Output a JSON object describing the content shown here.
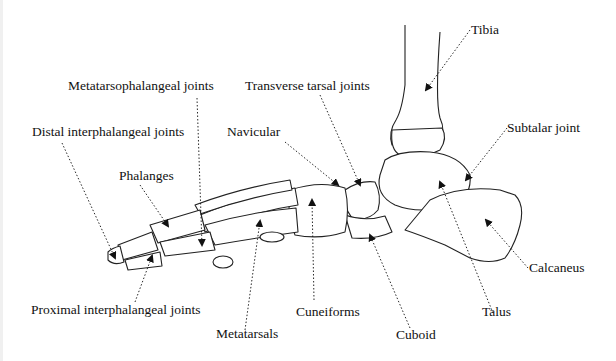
{
  "diagram": {
    "labels": {
      "tibia": "Tibia",
      "transverse_tarsal_joints": "Transverse tarsal joints",
      "metatarsophalangeal_joints": "Metatarsophalangeal joints",
      "distal_interphalangeal_joints": "Distal interphalangeal joints",
      "navicular": "Navicular",
      "subtalar_joint": "Subtalar joint",
      "phalanges": "Phalanges",
      "calcaneus": "Calcaneus",
      "proximal_interphalangeal_joints": "Proximal interphalangeal joints",
      "cuneiforms": "Cuneiforms",
      "metatarsals": "Metatarsals",
      "cuboid": "Cuboid",
      "talus": "Talus"
    },
    "colors": {
      "background": "#ffffff",
      "ink": "#111111"
    }
  }
}
